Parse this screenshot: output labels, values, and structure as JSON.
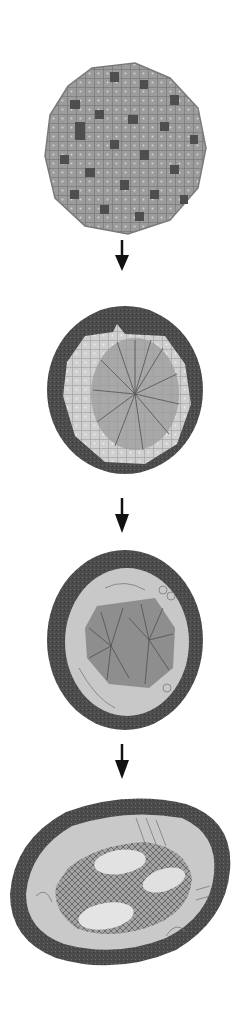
{
  "diagram": {
    "type": "vertical-sequence",
    "colors": {
      "background": "#ffffff",
      "arrow": "#111111",
      "outer_ring": "#4a4a4a",
      "light_region": "#c9c9c9",
      "cell_fill": "#9a9a9a",
      "dark_cell": "#555555",
      "nucleus": "#e2e2e2"
    },
    "stages": [
      {
        "index": 1,
        "name": "cellular-disc",
        "shape": "round",
        "features": [
          "polygonal cells",
          "scattered dark cells"
        ]
      },
      {
        "index": 2,
        "name": "ringed-disc-radial-center",
        "shape": "round",
        "features": [
          "dark outer ring",
          "light cell region",
          "radial striated center"
        ]
      },
      {
        "index": 3,
        "name": "ringed-disc-double-radial",
        "shape": "oval",
        "features": [
          "dark outer ring",
          "pale zone with fibers",
          "two radial centers"
        ]
      },
      {
        "index": 4,
        "name": "oval-with-three-nuclei",
        "shape": "tilted oval",
        "features": [
          "dark outer ring",
          "pale zone with fibers",
          "cross-hatched core",
          "three pale oval bodies"
        ]
      }
    ],
    "arrows": [
      {
        "from": 1,
        "to": 2,
        "direction": "down"
      },
      {
        "from": 2,
        "to": 3,
        "direction": "down"
      },
      {
        "from": 3,
        "to": 4,
        "direction": "down"
      }
    ]
  }
}
